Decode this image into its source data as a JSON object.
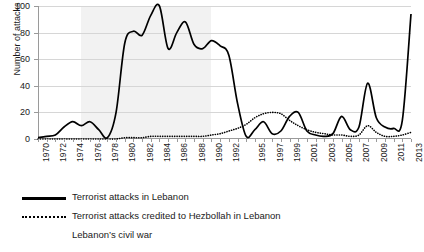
{
  "chart_data": {
    "type": "line",
    "title": "",
    "xlabel": "",
    "ylabel": "Number of attacks",
    "ylim": [
      0,
      100
    ],
    "yticks": [
      0,
      20,
      40,
      60,
      80,
      100
    ],
    "grid": true,
    "legend_position": "bottom-left",
    "x": [
      1970,
      1971,
      1972,
      1973,
      1974,
      1975,
      1976,
      1977,
      1978,
      1979,
      1980,
      1981,
      1982,
      1983,
      1984,
      1985,
      1986,
      1987,
      1988,
      1989,
      1990,
      1991,
      1992,
      1993,
      1994,
      1995,
      1996,
      1997,
      1998,
      1999,
      2000,
      2001,
      2002,
      2003,
      2004,
      2005,
      2006,
      2007,
      2008,
      2009,
      2010,
      2011,
      2012,
      2013
    ],
    "xtick_labels": [
      "1970",
      "1972",
      "1974",
      "1976",
      "1978",
      "1980",
      "1982",
      "1984",
      "1986",
      "1988",
      "1990",
      "1992",
      "1995",
      "1997",
      "1999",
      "2001",
      "2003",
      "2005",
      "2007",
      "2009",
      "2011",
      "2013"
    ],
    "series": [
      {
        "name": "Terrorist attacks in Lebanon",
        "style": "solid",
        "color": "#000000",
        "values": [
          1,
          2,
          3,
          9,
          13,
          10,
          13,
          7,
          1,
          20,
          72,
          81,
          78,
          93,
          100,
          68,
          80,
          88,
          71,
          68,
          74,
          70,
          63,
          27,
          2,
          7,
          13,
          4,
          6,
          17,
          20,
          6,
          3,
          2,
          4,
          17,
          7,
          9,
          42,
          16,
          9,
          8,
          14,
          94
        ]
      },
      {
        "name": "Terrorist attacks credited to Hezbollah in Lebanon",
        "style": "dotted",
        "color": "#000000",
        "values": [
          0,
          0,
          0,
          0,
          0,
          0,
          0,
          0,
          0,
          0,
          1,
          1,
          1,
          2,
          2,
          2,
          2,
          2,
          2,
          2,
          3,
          4,
          6,
          8,
          11,
          16,
          19,
          20,
          19,
          14,
          10,
          7,
          5,
          4,
          3,
          3,
          2,
          3,
          10,
          5,
          2,
          2,
          3,
          5
        ]
      }
    ],
    "shaded_region": {
      "label": "Lebanon's civil war",
      "start": 1975,
      "end": 1990,
      "color": "#f2f2f2"
    }
  },
  "legend": {
    "entries": [
      {
        "label": "Terrorist attacks in Lebanon",
        "style": "solid"
      },
      {
        "label": "Terrorist attacks credited to Hezbollah in Lebanon",
        "style": "dotted"
      },
      {
        "label": "Lebanon’s civil war",
        "style": "shaded"
      }
    ]
  }
}
